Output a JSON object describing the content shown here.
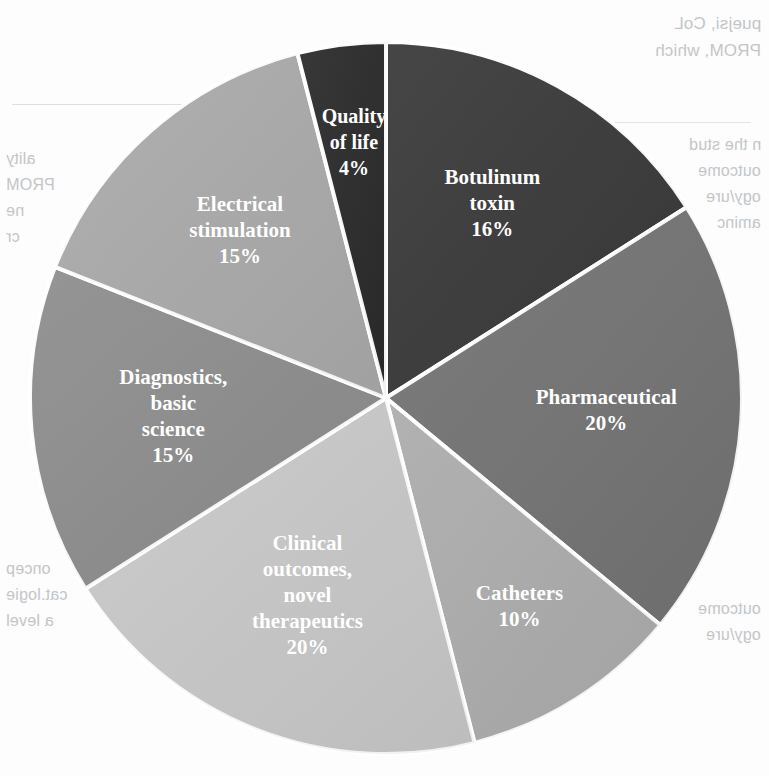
{
  "figure": {
    "background_color": "#fdfdfd",
    "label_color": "#ffffff",
    "slice_border_color": "#ffffff"
  },
  "chart_data": {
    "type": "pie",
    "title": "",
    "subtitle": "",
    "xlabel": "",
    "ylabel": "",
    "legend_position": "none",
    "grid": false,
    "labels_inside_slices": true,
    "value_suffix": "%",
    "total": 100,
    "start_angle_deg": 0,
    "direction": "clockwise",
    "categories": [
      "Botulinum toxin",
      "Pharmaceutical",
      "Catheters",
      "Clinical outcomes, novel therapeutics",
      "Diagnostics, basic science",
      "Electrical stimulation",
      "Quality of life"
    ],
    "values": [
      16,
      20,
      10,
      20,
      15,
      15,
      4
    ],
    "colors": [
      "#3a3a3a",
      "#747474",
      "#adadad",
      "#c9c9c9",
      "#8e8e8e",
      "#ababab",
      "#2b2b2b"
    ],
    "slices": [
      {
        "label": "Botulinum toxin",
        "value": 16,
        "value_text": "16%",
        "color": "#3a3a3a",
        "label_lines": [
          "Botulinum",
          "toxin",
          "16%"
        ]
      },
      {
        "label": "Pharmaceutical",
        "value": 20,
        "value_text": "20%",
        "color": "#747474",
        "label_lines": [
          "Pharmaceutical",
          "20%"
        ]
      },
      {
        "label": "Catheters",
        "value": 10,
        "value_text": "10%",
        "color": "#adadad",
        "label_lines": [
          "Catheters",
          "10%"
        ]
      },
      {
        "label": "Clinical outcomes, novel therapeutics",
        "value": 20,
        "value_text": "20%",
        "color": "#c9c9c9",
        "label_lines": [
          "Clinical",
          "outcomes,",
          "novel",
          "therapeutics",
          "20%"
        ]
      },
      {
        "label": "Diagnostics, basic science",
        "value": 15,
        "value_text": "15%",
        "color": "#8e8e8e",
        "label_lines": [
          "Diagnostics,",
          "basic",
          "science",
          "15%"
        ]
      },
      {
        "label": "Electrical stimulation",
        "value": 15,
        "value_text": "15%",
        "color": "#ababab",
        "label_lines": [
          "Electrical",
          "stimulation",
          "15%"
        ]
      },
      {
        "label": "Quality of life",
        "value": 4,
        "value_text": "4%",
        "color": "#2b2b2b",
        "label_lines": [
          "Quality",
          "of life",
          "4%"
        ]
      }
    ]
  },
  "showthrough": {
    "note": "faint mirrored text bleeding through from the reverse side of the printed page",
    "right_block_1": [
      "puejsi, CoL",
      "PROM, which"
    ],
    "right_block_2": [
      "n the stud",
      "outcome",
      "ogy/ure",
      "aminc"
    ],
    "left_block_1": [
      "ality",
      "PROM",
      "ne",
      "cr"
    ],
    "left_block_2": [
      "d",
      "e",
      "b",
      "u"
    ],
    "bottom_block": [
      "oncep",
      "cat.logie",
      "a level"
    ]
  }
}
